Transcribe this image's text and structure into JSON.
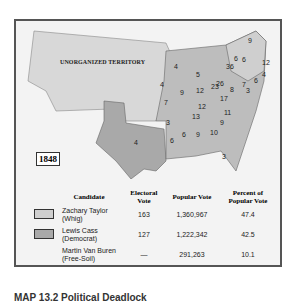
{
  "map": {
    "year": "1848",
    "territory_label": "UNORGANIZED TERRITORY",
    "colors": {
      "whig": "#cfcfcf",
      "democrat": "#a9a9a9",
      "territory": "#d8d8d8",
      "background": "#f3f3f3"
    },
    "electoral_labels": [
      "9",
      "6",
      "6",
      "12",
      "36",
      "4",
      "6",
      "4",
      "5",
      "26",
      "7",
      "8",
      "3",
      "4",
      "9",
      "12",
      "23",
      "7",
      "12",
      "17",
      "13",
      "11",
      "3",
      "6",
      "9",
      "10",
      "9",
      "4",
      "6",
      "3"
    ]
  },
  "table": {
    "headers": [
      "Candidate",
      "Electoral Vote",
      "Popular Vote",
      "Percent of Popular Vote"
    ],
    "rows": [
      {
        "name": "Zachary Taylor",
        "party": "(Whig)",
        "electoral": "163",
        "popular": "1,360,967",
        "percent": "47.4",
        "swatch": "#cfcfcf"
      },
      {
        "name": "Lewis Cass",
        "party": "(Democrat)",
        "electoral": "127",
        "popular": "1,222,342",
        "percent": "42.5",
        "swatch": "#a9a9a9"
      },
      {
        "name": "Martin Van Buren",
        "party": "(Free-Soil)",
        "electoral": "—",
        "popular": "291,263",
        "percent": "10.1",
        "swatch": ""
      }
    ]
  },
  "caption": "MAP 13.2 Political Deadlock"
}
